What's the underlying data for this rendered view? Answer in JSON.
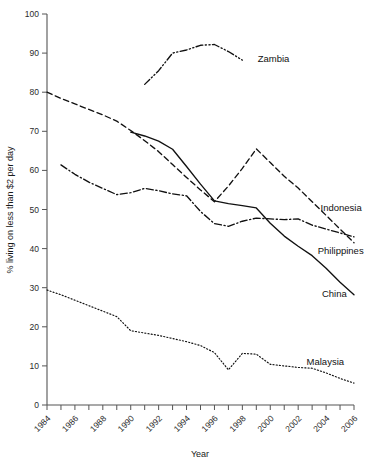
{
  "chart_data": {
    "type": "line",
    "title": "",
    "xlabel": "Year",
    "ylabel": "% living on less than $2 per day",
    "xlim": [
      1984,
      2006
    ],
    "ylim": [
      0,
      100
    ],
    "xticks": [
      "1984",
      "1986",
      "1988",
      "1990",
      "1992",
      "1994",
      "1996",
      "1998",
      "2000",
      "2002",
      "2004",
      "2006"
    ],
    "yticks": [
      "0",
      "10",
      "20",
      "30",
      "40",
      "50",
      "60",
      "70",
      "80",
      "90",
      "100"
    ],
    "grid": false,
    "legend_position": "inline-right-of-line-ends",
    "series": [
      {
        "name": "Zambia",
        "style": "dash-dot-dot",
        "label_x": 1999.1,
        "label_y": 88.5,
        "x": [
          1991,
          1992,
          1993,
          1994,
          1995,
          1996,
          1997,
          1998
        ],
        "values": [
          82.0,
          85.5,
          90.0,
          90.8,
          92.0,
          92.2,
          90.4,
          88.2
        ]
      },
      {
        "name": "Indonesia",
        "style": "dashed",
        "label_x": 2003.6,
        "label_y": 50.5,
        "x": [
          1984,
          1985,
          1986,
          1987,
          1988,
          1989,
          1990,
          1991,
          1992,
          1993,
          1994,
          1995,
          1996,
          1997,
          1998,
          1999,
          2000,
          2001,
          2002,
          2003,
          2004,
          2005,
          2006
        ],
        "values": [
          80.0,
          78.4,
          77.0,
          75.6,
          74.2,
          72.6,
          70.2,
          67.6,
          64.8,
          61.5,
          58.2,
          55.0,
          52.0,
          56.0,
          60.5,
          65.5,
          62.0,
          58.5,
          55.5,
          52.0,
          48.5,
          45.0,
          41.5
        ]
      },
      {
        "name": "Philippines",
        "style": "dash-dot",
        "label_x": 2003.4,
        "label_y": 39.5,
        "x": [
          1985,
          1986,
          1987,
          1988,
          1989,
          1990,
          1991,
          1992,
          1993,
          1994,
          1995,
          1996,
          1997,
          1998,
          1999,
          2000,
          2001,
          2002,
          2003,
          2004,
          2005,
          2006
        ],
        "values": [
          61.4,
          59.0,
          57.0,
          55.4,
          53.8,
          54.3,
          55.4,
          54.8,
          54.0,
          53.5,
          49.5,
          46.4,
          45.7,
          47.0,
          47.8,
          47.6,
          47.4,
          47.6,
          46.0,
          45.0,
          44.0,
          43.0
        ]
      },
      {
        "name": "China",
        "style": "solid",
        "label_x": 2003.7,
        "label_y": 28.5,
        "x": [
          1990,
          1991,
          1992,
          1993,
          1994,
          1995,
          1996,
          1997,
          1998,
          1999,
          2000,
          2001,
          2002,
          2003,
          2004,
          2005,
          2006
        ],
        "values": [
          69.8,
          68.8,
          67.5,
          65.4,
          61.0,
          56.5,
          52.2,
          51.5,
          51.0,
          50.4,
          46.5,
          43.2,
          40.6,
          38.2,
          35.0,
          31.4,
          28.2
        ]
      },
      {
        "name": "Malaysia",
        "style": "dotted",
        "label_x": 2002.6,
        "label_y": 11.0,
        "x": [
          1984,
          1985,
          1986,
          1987,
          1988,
          1989,
          1990,
          1991,
          1992,
          1993,
          1994,
          1995,
          1996,
          1997,
          1998,
          1999,
          2000,
          2001,
          2002,
          2003,
          2004,
          2005,
          2006
        ],
        "values": [
          29.4,
          28.2,
          26.8,
          25.4,
          24.0,
          22.6,
          19.0,
          18.4,
          17.8,
          17.0,
          16.2,
          15.2,
          13.4,
          9.0,
          13.2,
          13.0,
          10.4,
          10.0,
          9.6,
          9.4,
          8.2,
          6.8,
          5.6
        ]
      }
    ]
  }
}
